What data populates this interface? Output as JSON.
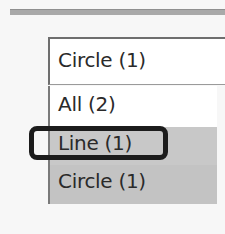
{
  "combobox": {
    "selected_value": "Circle (1)"
  },
  "dropdown": {
    "options": [
      {
        "label": "All (2)"
      },
      {
        "label": "Line (1)"
      },
      {
        "label": "Circle (1)"
      }
    ],
    "highlighted_index": 1
  },
  "colors": {
    "highlight_border": "#1c1c1c",
    "item_hover_bg": "#c8c8c8"
  }
}
